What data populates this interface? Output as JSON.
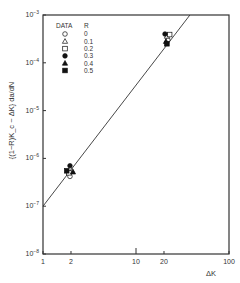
{
  "chart_data": {
    "type": "scatter",
    "title": "",
    "xlabel": "ΔK",
    "ylabel": "{(1−R)K_c − ΔK} da/dN",
    "xscale": "log",
    "yscale": "log",
    "xlim": [
      1,
      100
    ],
    "ylim": [
      1e-08,
      0.001
    ],
    "x_ticks": [
      {
        "value": 1,
        "label": "1"
      },
      {
        "value": 2,
        "label": "2"
      },
      {
        "value": 10,
        "label": "10"
      },
      {
        "value": 20,
        "label": "20"
      },
      {
        "value": 100,
        "label": "100"
      }
    ],
    "y_ticks": [
      {
        "value": 0.001,
        "base": "10",
        "exp": "-3"
      },
      {
        "value": 0.0001,
        "base": "10",
        "exp": "-4"
      },
      {
        "value": 1e-05,
        "base": "10",
        "exp": "-5"
      },
      {
        "value": 1e-06,
        "base": "10",
        "exp": "-6"
      },
      {
        "value": 1e-07,
        "base": "10",
        "exp": "-7"
      },
      {
        "value": 1e-08,
        "base": "10",
        "exp": "-8"
      }
    ],
    "grid": false,
    "legend": {
      "position": "upper-left",
      "header_data": "DATA",
      "header_r": "R",
      "entries": [
        {
          "marker": "open-circle",
          "R": "0"
        },
        {
          "marker": "open-triangle",
          "R": "0.1"
        },
        {
          "marker": "open-square",
          "R": "0.2"
        },
        {
          "marker": "filled-circle",
          "R": "0.3"
        },
        {
          "marker": "filled-triangle",
          "R": "0.4"
        },
        {
          "marker": "filled-square",
          "R": "0.5"
        }
      ]
    },
    "series": [
      {
        "name": "R=0",
        "marker": "open-circle",
        "points": [
          [
            1.95,
            4.2e-07
          ],
          [
            22,
            0.0003
          ]
        ]
      },
      {
        "name": "R=0.1",
        "marker": "open-triangle",
        "points": [
          [
            2.05,
            5.5e-07
          ],
          [
            21.5,
            0.00036
          ]
        ]
      },
      {
        "name": "R=0.2",
        "marker": "open-square",
        "points": [
          [
            1.9,
            5e-07
          ],
          [
            23,
            0.00039
          ]
        ]
      },
      {
        "name": "R=0.3",
        "marker": "filled-circle",
        "points": [
          [
            1.95,
            7e-07
          ],
          [
            20.5,
            0.0004
          ]
        ]
      },
      {
        "name": "R=0.4",
        "marker": "filled-triangle",
        "points": [
          [
            2.1,
            5.2e-07
          ],
          [
            21,
            0.00028
          ]
        ]
      },
      {
        "name": "R=0.5",
        "marker": "filled-square",
        "points": [
          [
            1.8,
            5.5e-07
          ],
          [
            21.5,
            0.00025
          ]
        ]
      }
    ],
    "fit_line": {
      "x": [
        1,
        38
      ],
      "y": [
        1e-07,
        0.001
      ]
    },
    "annotations": []
  }
}
